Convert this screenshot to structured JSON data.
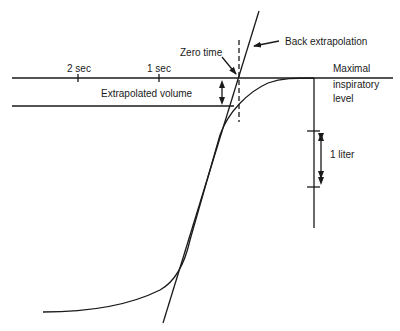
{
  "diagram": {
    "type": "spirometry-back-extrapolation",
    "labels": {
      "zero_time": "Zero time",
      "back_extrapolation": "Back extrapolation",
      "two_sec": "2 sec",
      "one_sec": "1 sec",
      "extrapolated_volume": "Extrapolated volume",
      "maximal_line1": "Maximal",
      "maximal_line2": "inspiratory",
      "maximal_line3": "level",
      "one_liter": "1 liter"
    },
    "colors": {
      "ink": "#1a1a1a",
      "background": "#ffffff"
    }
  }
}
